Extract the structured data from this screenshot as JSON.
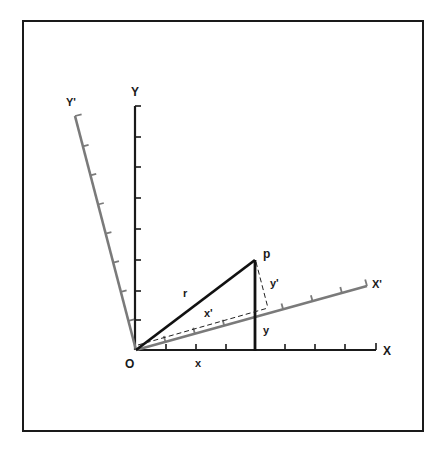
{
  "figure": {
    "colors": {
      "frame": "#1a1a1a",
      "original_axes": "#1a1a1a",
      "rotated_axes": "#7a7a7a",
      "radius_line": "#111111",
      "dashed_lines": "#222222"
    },
    "labels": {
      "origin": "O",
      "x_axis": "X",
      "y_axis": "Y",
      "x_prime_axis": "X'",
      "y_prime_axis": "Y'",
      "point": "p",
      "radius": "r",
      "x_component": "x",
      "y_component": "y",
      "x_prime_component": "x'",
      "y_prime_component": "y'"
    },
    "geometry": {
      "origin": [
        136,
        350
      ],
      "x_axis_end": [
        376,
        350
      ],
      "y_axis_end": [
        135,
        106
      ],
      "x_axis_ticks": 8,
      "y_axis_ticks": 8,
      "tick_spacing": 30,
      "rotation_angle_deg": 15.5,
      "rotated_axis_length": 240,
      "rotated_axis_ticks": 7,
      "point_p": [
        255,
        260
      ]
    }
  }
}
